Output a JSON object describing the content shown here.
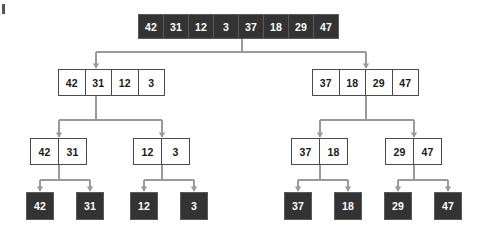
{
  "diagram": {
    "colors": {
      "dark_fill": "#333333",
      "dark_text": "#ffffff",
      "light_fill": "#ffffff",
      "light_text": "#1a1a1a",
      "border": "#4a4a4a",
      "connector": "#9a9a9a",
      "background": "#ffffff"
    },
    "levels": [
      {
        "level": 0,
        "style": "dark",
        "nodes": [
          {
            "id": "root",
            "values": [
              42,
              31,
              12,
              3,
              37,
              18,
              29,
              47
            ],
            "x": 138,
            "y": 14,
            "cell_w": 26,
            "cell_h": 25
          }
        ]
      },
      {
        "level": 1,
        "style": "light",
        "nodes": [
          {
            "id": "L",
            "values": [
              42,
              31,
              12,
              3
            ],
            "x": 58,
            "y": 69,
            "cell_w": 27.5,
            "cell_h": 27
          },
          {
            "id": "R",
            "values": [
              37,
              18,
              29,
              47
            ],
            "x": 312,
            "y": 69,
            "cell_w": 27.5,
            "cell_h": 27
          }
        ]
      },
      {
        "level": 2,
        "style": "light",
        "nodes": [
          {
            "id": "LL",
            "values": [
              42,
              31
            ],
            "x": 30,
            "y": 138,
            "cell_w": 29,
            "cell_h": 27
          },
          {
            "id": "LR",
            "values": [
              12,
              3
            ],
            "x": 133,
            "y": 138,
            "cell_w": 29,
            "cell_h": 27
          },
          {
            "id": "RL",
            "values": [
              37,
              18
            ],
            "x": 291,
            "y": 138,
            "cell_w": 29,
            "cell_h": 27
          },
          {
            "id": "RR",
            "values": [
              29,
              47
            ],
            "x": 385,
            "y": 138,
            "cell_w": 29,
            "cell_h": 27
          }
        ]
      },
      {
        "level": 3,
        "style": "dark",
        "nodes": [
          {
            "id": "L0",
            "values": [
              42
            ],
            "x": 26,
            "y": 192,
            "cell_w": 28,
            "cell_h": 28
          },
          {
            "id": "L1",
            "values": [
              31
            ],
            "x": 76,
            "y": 192,
            "cell_w": 28,
            "cell_h": 28
          },
          {
            "id": "L2",
            "values": [
              12
            ],
            "x": 130,
            "y": 192,
            "cell_w": 28,
            "cell_h": 28
          },
          {
            "id": "L3",
            "values": [
              3
            ],
            "x": 180,
            "y": 192,
            "cell_w": 28,
            "cell_h": 28
          },
          {
            "id": "R0",
            "values": [
              37
            ],
            "x": 284,
            "y": 192,
            "cell_w": 28,
            "cell_h": 28
          },
          {
            "id": "R1",
            "values": [
              18
            ],
            "x": 334,
            "y": 192,
            "cell_w": 28,
            "cell_h": 28
          },
          {
            "id": "R2",
            "values": [
              29
            ],
            "x": 384,
            "y": 192,
            "cell_w": 28,
            "cell_h": 28
          },
          {
            "id": "R3",
            "values": [
              47
            ],
            "x": 434,
            "y": 192,
            "cell_w": 28,
            "cell_h": 28
          }
        ]
      }
    ],
    "connectors": [
      {
        "from": "root",
        "from_x": 242,
        "from_y": 39,
        "bus_y": 52,
        "to": [
          {
            "x": 96,
            "y": 69
          },
          {
            "x": 366,
            "y": 69
          }
        ]
      },
      {
        "from": "L",
        "from_x": 96,
        "from_y": 96,
        "bus_y": 120,
        "to": [
          {
            "x": 59,
            "y": 138
          },
          {
            "x": 162,
            "y": 138
          }
        ]
      },
      {
        "from": "R",
        "from_x": 366,
        "from_y": 96,
        "bus_y": 120,
        "to": [
          {
            "x": 320,
            "y": 138
          },
          {
            "x": 414,
            "y": 138
          }
        ]
      },
      {
        "from": "LL",
        "from_x": 59,
        "from_y": 165,
        "bus_y": 180,
        "to": [
          {
            "x": 40,
            "y": 192
          },
          {
            "x": 90,
            "y": 192
          }
        ]
      },
      {
        "from": "LR",
        "from_x": 162,
        "from_y": 165,
        "bus_y": 180,
        "to": [
          {
            "x": 144,
            "y": 192
          },
          {
            "x": 194,
            "y": 192
          }
        ]
      },
      {
        "from": "RL",
        "from_x": 320,
        "from_y": 165,
        "bus_y": 180,
        "to": [
          {
            "x": 298,
            "y": 192
          },
          {
            "x": 348,
            "y": 192
          }
        ]
      },
      {
        "from": "RR",
        "from_x": 414,
        "from_y": 165,
        "bus_y": 180,
        "to": [
          {
            "x": 398,
            "y": 192
          },
          {
            "x": 448,
            "y": 192
          }
        ]
      }
    ]
  }
}
